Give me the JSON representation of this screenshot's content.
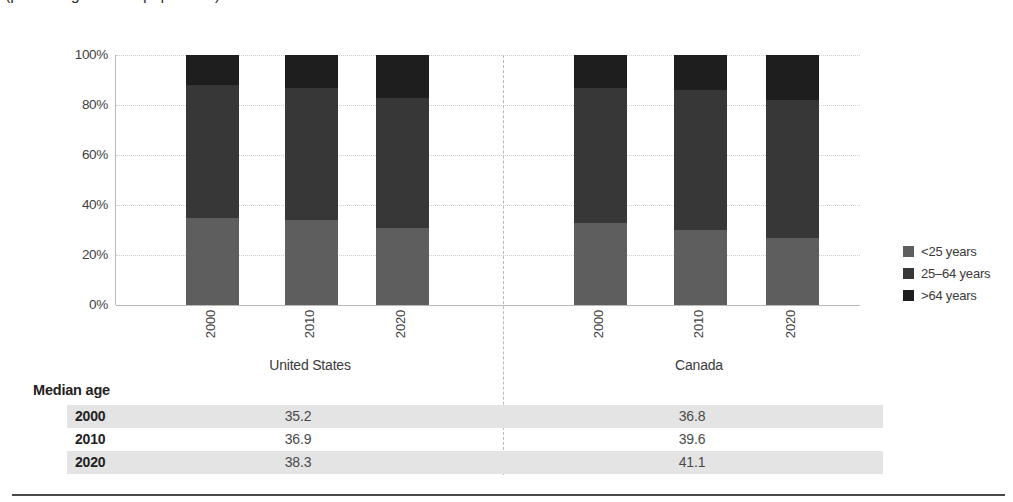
{
  "subtitle": "(percentage of total population)",
  "chart_data": {
    "type": "bar",
    "stacked": true,
    "unit": "percent",
    "ylim": [
      0,
      100
    ],
    "yticks": [
      "0%",
      "20%",
      "40%",
      "60%",
      "80%",
      "100%"
    ],
    "grid": "horizontal-dotted",
    "legend_position": "right",
    "groups": [
      {
        "label": "United States",
        "categories": [
          "2000",
          "2010",
          "2020"
        ],
        "series": [
          {
            "name": "<25 years",
            "values": [
              35,
              34,
              31
            ]
          },
          {
            "name": "25–64 years",
            "values": [
              53,
              53,
              52
            ]
          },
          {
            "name": ">64 years",
            "values": [
              12,
              13,
              17
            ]
          }
        ]
      },
      {
        "label": "Canada",
        "categories": [
          "2000",
          "2010",
          "2020"
        ],
        "series": [
          {
            "name": "<25 years",
            "values": [
              33,
              30,
              27
            ]
          },
          {
            "name": "25–64 years",
            "values": [
              54,
              56,
              55
            ]
          },
          {
            "name": ">64 years",
            "values": [
              13,
              14,
              18
            ]
          }
        ]
      }
    ]
  },
  "legend": [
    {
      "label": "<25 years",
      "color": "#5e5e5e"
    },
    {
      "label": "25–64 years",
      "color": "#373737"
    },
    {
      "label": ">64 years",
      "color": "#1e1e1e"
    }
  ],
  "table": {
    "title": "Median age",
    "columns": [
      "United States",
      "Canada"
    ],
    "rows": [
      {
        "year": "2000",
        "values": [
          "35.2",
          "36.8"
        ]
      },
      {
        "year": "2010",
        "values": [
          "36.9",
          "39.6"
        ]
      },
      {
        "year": "2020",
        "values": [
          "38.3",
          "41.1"
        ]
      }
    ]
  }
}
